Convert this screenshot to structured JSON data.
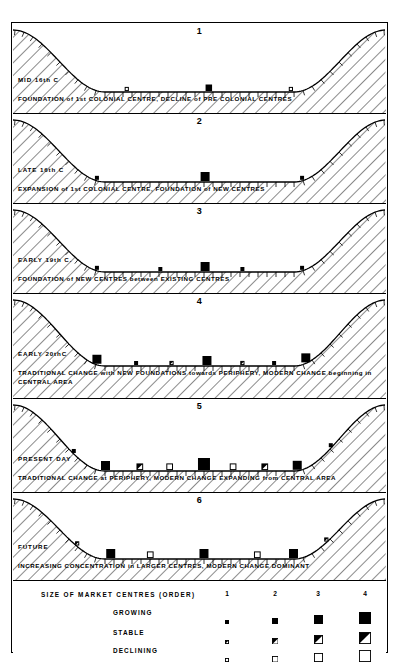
{
  "figure": {
    "panel_count": 6
  },
  "panels": [
    {
      "number": "1",
      "era": "MID 16th C",
      "caption": "FOUNDATION of 1st COLONIAL CENTRE, DECLINE of PRE COLONIAL CENTRES",
      "caption2": "",
      "symbols": [
        {
          "type": "declining",
          "order": 1,
          "x": 0.305,
          "on": "baseline"
        },
        {
          "type": "growing",
          "order": 2,
          "x": 0.525,
          "on": "baseline"
        },
        {
          "type": "declining",
          "order": 1,
          "x": 0.745,
          "on": "baseline"
        }
      ]
    },
    {
      "number": "2",
      "era": "LATE 16th C",
      "caption": "EXPANSION of 1st COLONIAL CENTRE, FOUNDATION of NEW CENTRES",
      "caption2": "",
      "symbols": [
        {
          "type": "growing",
          "order": 1,
          "x": 0.225,
          "on": "slope-left"
        },
        {
          "type": "growing",
          "order": 3,
          "x": 0.515,
          "on": "baseline"
        },
        {
          "type": "growing",
          "order": 1,
          "x": 0.775,
          "on": "slope-right"
        }
      ]
    },
    {
      "number": "3",
      "era": "EARLY 19th C.",
      "caption": "FOUNDATION of NEW CENTRES between EXISTING CENTRES",
      "caption2": "",
      "symbols": [
        {
          "type": "growing",
          "order": 1,
          "x": 0.225,
          "on": "slope-left"
        },
        {
          "type": "growing",
          "order": 1,
          "x": 0.395,
          "on": "baseline"
        },
        {
          "type": "growing",
          "order": 3,
          "x": 0.515,
          "on": "baseline"
        },
        {
          "type": "growing",
          "order": 1,
          "x": 0.615,
          "on": "baseline"
        },
        {
          "type": "growing",
          "order": 1,
          "x": 0.775,
          "on": "slope-right"
        }
      ]
    },
    {
      "number": "4",
      "era": "EARLY 20thC",
      "caption": "TRADITIONAL CHANGE with NEW FOUNDATIONS towards PERIPHERY, MODERN CHANGE beginning in",
      "caption2": "CENTRAL AREA",
      "symbols": [
        {
          "type": "growing",
          "order": 3,
          "x": 0.225,
          "on": "slope-left"
        },
        {
          "type": "growing",
          "order": 1,
          "x": 0.33,
          "on": "baseline"
        },
        {
          "type": "stable",
          "order": 1,
          "x": 0.425,
          "on": "baseline"
        },
        {
          "type": "growing",
          "order": 3,
          "x": 0.52,
          "on": "baseline"
        },
        {
          "type": "stable",
          "order": 1,
          "x": 0.615,
          "on": "baseline"
        },
        {
          "type": "growing",
          "order": 1,
          "x": 0.7,
          "on": "baseline"
        },
        {
          "type": "growing",
          "order": 3,
          "x": 0.785,
          "on": "slope-right"
        }
      ]
    },
    {
      "number": "5",
      "era": "PRESENT DAY",
      "caption": "TRADITIONAL CHANGE at PERIPHERY, MODERN CHANGE EXPANDING from CENTRAL AREA",
      "caption2": "",
      "symbols": [
        {
          "type": "growing",
          "order": 1,
          "x": 0.163,
          "on": "slope-left-high"
        },
        {
          "type": "growing",
          "order": 3,
          "x": 0.248,
          "on": "slope-left"
        },
        {
          "type": "stable",
          "order": 2,
          "x": 0.34,
          "on": "baseline"
        },
        {
          "type": "declining",
          "order": 2,
          "x": 0.42,
          "on": "baseline"
        },
        {
          "type": "growing",
          "order": 4,
          "x": 0.512,
          "on": "baseline"
        },
        {
          "type": "declining",
          "order": 2,
          "x": 0.59,
          "on": "baseline"
        },
        {
          "type": "stable",
          "order": 2,
          "x": 0.675,
          "on": "baseline"
        },
        {
          "type": "growing",
          "order": 3,
          "x": 0.762,
          "on": "slope-right"
        },
        {
          "type": "growing",
          "order": 1,
          "x": 0.852,
          "on": "slope-right-high"
        }
      ]
    },
    {
      "number": "6",
      "era": "FUTURE",
      "caption": "INCREASING CONCENTRATION in LARGER CENTRES, MODERN CHANGE DOMINANT",
      "caption2": "",
      "symbols": [
        {
          "type": "stable",
          "order": 1,
          "x": 0.172,
          "on": "slope-left-high"
        },
        {
          "type": "growing",
          "order": 3,
          "x": 0.262,
          "on": "slope-left"
        },
        {
          "type": "declining",
          "order": 2,
          "x": 0.368,
          "on": "baseline"
        },
        {
          "type": "growing",
          "order": 3,
          "x": 0.512,
          "on": "baseline"
        },
        {
          "type": "declining",
          "order": 2,
          "x": 0.655,
          "on": "baseline"
        },
        {
          "type": "growing",
          "order": 3,
          "x": 0.752,
          "on": "slope-right"
        },
        {
          "type": "stable",
          "order": 1,
          "x": 0.84,
          "on": "slope-right-high"
        }
      ]
    }
  ],
  "legend": {
    "title": "SIZE OF MARKET CENTRES (ORDER)",
    "orders": [
      "1",
      "2",
      "3",
      "4"
    ],
    "rows": [
      {
        "label": "GROWING",
        "type": "growing"
      },
      {
        "label": "STABLE",
        "type": "stable"
      },
      {
        "label": "DECLINING",
        "type": "declining"
      }
    ],
    "sizes": [
      4,
      6.5,
      9,
      12
    ]
  },
  "style": {
    "ink": "#000000",
    "paper": "#ffffff",
    "hatch_spacing": 9
  }
}
